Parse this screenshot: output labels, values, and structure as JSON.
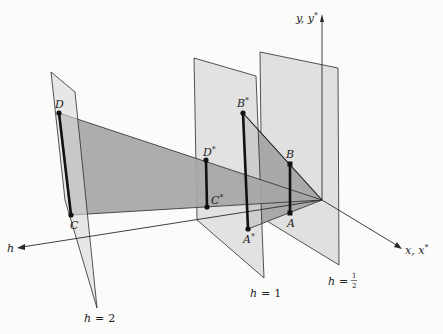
{
  "colors": {
    "background": "#fbfbfa",
    "plane_fill": "#dcdcdc",
    "shade_fill": "#a8a8a8",
    "line": "#2a2a2a",
    "thick_line": "#111111"
  },
  "axes": {
    "y_label": "y, y",
    "y_label_star": "*",
    "x_label": "x, x",
    "x_label_star": "*",
    "h_label": "h"
  },
  "planes": [
    {
      "id": "h2",
      "label_var": "h",
      "label_eq": "=",
      "label_val": "2"
    },
    {
      "id": "h1",
      "label_var": "h",
      "label_eq": "=",
      "label_val": "1"
    },
    {
      "id": "h_half",
      "label_var": "h",
      "label_eq": "=",
      "label_num": "1",
      "label_den": "2"
    }
  ],
  "points": {
    "D": "D",
    "C": "C",
    "D_star": "D",
    "C_star": "C",
    "B_star": "B",
    "A_star": "A",
    "B": "B",
    "A": "A",
    "star": "*"
  }
}
